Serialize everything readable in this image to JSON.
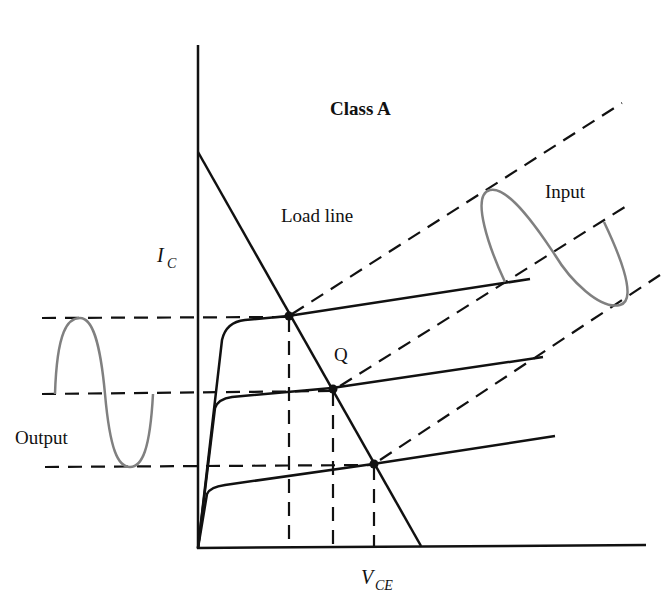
{
  "title": "Class A",
  "labels": {
    "load_line": "Load line",
    "input": "Input",
    "output": "Output",
    "q_point": "Q",
    "y_axis_main": "I",
    "y_axis_sub": "C",
    "x_axis_main": "V",
    "x_axis_sub": "CE"
  },
  "colors": {
    "line": "#111111",
    "signal": "#808080",
    "background": "#ffffff"
  },
  "diagram": {
    "type": "transistor characteristic curves with load line",
    "operating_points": [
      "upper",
      "Q",
      "lower"
    ],
    "curve_count": 3
  }
}
